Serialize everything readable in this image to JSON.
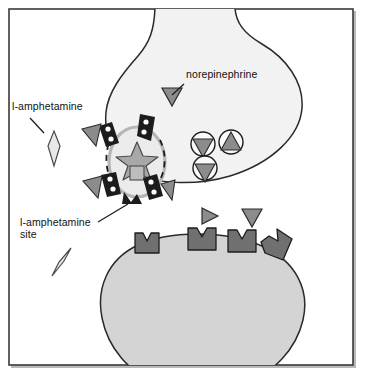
{
  "figure": {
    "type": "biological-diagram",
    "width": 382,
    "height": 388,
    "background_color": "#ffffff",
    "border_color": "#3a3a3a"
  },
  "labels": [
    {
      "id": "norepinephrine",
      "text": "norepinephrine",
      "x": 186,
      "y": 78,
      "anchor": "start",
      "leader_line": {
        "x1": 184,
        "y1": 84,
        "x2": 172,
        "y2": 95
      }
    },
    {
      "id": "l-amphetamine",
      "text": "l-amphetamine",
      "x": 12,
      "y": 110,
      "anchor": "start",
      "leader_line": {
        "x1": 30,
        "y1": 118,
        "x2": 44,
        "y2": 133
      }
    },
    {
      "id": "l-amphetamine-site-line1",
      "text": "l-amphetamine",
      "x": 20,
      "y": 226,
      "anchor": "start",
      "leader_line": {
        "x1": 98,
        "y1": 222,
        "x2": 128,
        "y2": 204
      }
    },
    {
      "id": "l-amphetamine-site-line2",
      "text": "site",
      "x": 20,
      "y": 238,
      "anchor": "start",
      "leader_line": null
    }
  ],
  "cells": {
    "presynaptic_terminal": {
      "name": "presynaptic-axon-terminal",
      "fill": "#f2f2f2",
      "stroke": "#2a2a2a",
      "description": "Flask-shaped nerve ending with narrow neck at top"
    },
    "postsynaptic_cell": {
      "name": "postsynaptic-cell",
      "fill": "#d4d4d4",
      "stroke": "#2a2a2a",
      "description": "Rounded target cell at bottom"
    }
  },
  "elements": {
    "transporter_vesicle": {
      "name": "reuptake-transporter-complex",
      "vesicle_fill": "#ebebeb",
      "vesicle_stroke": "#b5b5b5",
      "segment_fill": "#1c1c1c",
      "star_fill": "#a8a8a8",
      "star_stroke": "#4a4a4a",
      "segment_count": 5,
      "dot_color": "#ffffff"
    },
    "norepinephrine_molecule": {
      "name": "norepinephrine-triangle",
      "fill": "#8c8c8c",
      "stroke": "#2a2a2a",
      "shape": "triangle",
      "count_in_terminal": 1,
      "count_in_cleft": 2,
      "count_bound_to_transporter": 4
    },
    "amphetamine_molecule": {
      "name": "l-amphetamine-diamond",
      "fill": "#e8e8e8",
      "stroke": "#4a4a4a",
      "shape": "elongated-diamond",
      "count": 2
    },
    "storage_vesicles": {
      "name": "storage-vesicle",
      "circle_fill": "#fafafa",
      "circle_stroke": "#1c1c1c",
      "count": 3
    },
    "receptors": {
      "name": "postsynaptic-receptor",
      "fill": "#707070",
      "stroke": "#1c1c1c",
      "shape": "notched-block",
      "count": 4
    }
  },
  "colors": {
    "border": "#3a3a3a",
    "text": "#111111",
    "presynaptic_fill": "#f2f2f2",
    "postsynaptic_fill": "#d4d4d4",
    "molecule_gray": "#8c8c8c",
    "receptor_gray": "#707070",
    "dark": "#1c1c1c"
  }
}
